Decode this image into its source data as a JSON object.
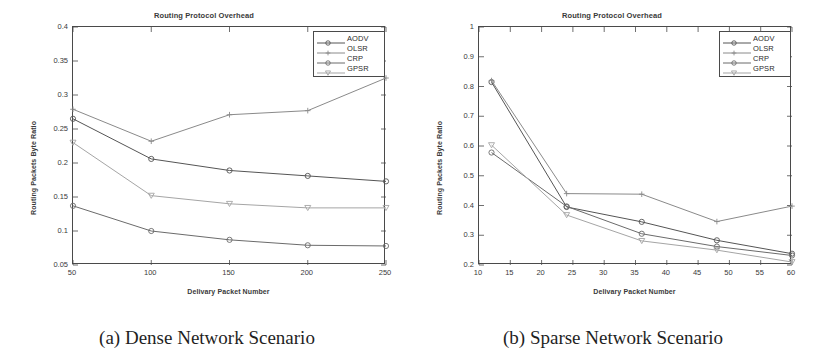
{
  "figure": {
    "panels": [
      {
        "id": "panel-a",
        "caption": "(a) Dense Network Scenario",
        "chart_data": {
          "type": "line",
          "title": "Routing Protocol Overhead",
          "xlabel": "Delivary Packet Number",
          "ylabel": "Routing Packets Byte Ratio",
          "x": [
            50,
            100,
            150,
            200,
            250
          ],
          "xtick_labels": [
            "50",
            "100",
            "150",
            "200",
            "250"
          ],
          "xlim": [
            50,
            250
          ],
          "ylim": [
            0.05,
            0.4
          ],
          "ytick_labels": [
            "0.4",
            "0.35",
            "0.3",
            "0.25",
            "0.2",
            "0.15",
            "0.1",
            "0.05"
          ],
          "yticks": [
            0.4,
            0.35,
            0.3,
            0.25,
            0.2,
            0.15,
            0.1,
            0.05
          ],
          "grid": false,
          "legend_position": "top-right",
          "series": [
            {
              "name": "AODV",
              "marker": "circle",
              "color": "#555555",
              "values": [
                0.265,
                0.206,
                0.189,
                0.181,
                0.173
              ]
            },
            {
              "name": "OLSR",
              "marker": "plus",
              "color": "#8a8a8a",
              "values": [
                0.279,
                0.232,
                0.271,
                0.277,
                0.325
              ]
            },
            {
              "name": "CRP",
              "marker": "circle",
              "color": "#6b6b6b",
              "values": [
                0.137,
                0.1,
                0.087,
                0.079,
                0.078
              ]
            },
            {
              "name": "GPSR",
              "marker": "triangle-down",
              "color": "#a5a5a5",
              "values": [
                0.23,
                0.152,
                0.14,
                0.134,
                0.134
              ]
            }
          ]
        }
      },
      {
        "id": "panel-b",
        "caption": "(b) Sparse Network Scenario",
        "chart_data": {
          "type": "line",
          "title": "Routing Protocol Overhead",
          "xlabel": "Delivary Packet Number",
          "ylabel": "Routing Packets Byte Ratio",
          "x": [
            12,
            24,
            36,
            48,
            60
          ],
          "xtick_labels": [
            "10",
            "15",
            "20",
            "25",
            "30",
            "35",
            "40",
            "45",
            "50",
            "55",
            "60"
          ],
          "xticks": [
            10,
            15,
            20,
            25,
            30,
            35,
            40,
            45,
            50,
            55,
            60
          ],
          "xlim": [
            10,
            60
          ],
          "ylim": [
            0.2,
            1.0
          ],
          "ytick_labels": [
            "1",
            "0.9",
            "0.8",
            "0.7",
            "0.6",
            "0.5",
            "0.4",
            "0.3",
            "0.2"
          ],
          "yticks": [
            1.0,
            0.9,
            0.8,
            0.7,
            0.6,
            0.5,
            0.4,
            0.3,
            0.2
          ],
          "grid": false,
          "legend_position": "top-right",
          "series": [
            {
              "name": "AODV",
              "marker": "circle",
              "color": "#555555",
              "values": [
                0.815,
                0.395,
                0.345,
                0.283,
                0.238
              ]
            },
            {
              "name": "OLSR",
              "marker": "plus",
              "color": "#8a8a8a",
              "values": [
                0.82,
                0.44,
                0.438,
                0.346,
                0.398
              ]
            },
            {
              "name": "CRP",
              "marker": "circle",
              "color": "#6b6b6b",
              "values": [
                0.578,
                0.397,
                0.305,
                0.262,
                0.232
              ]
            },
            {
              "name": "GPSR",
              "marker": "triangle-down",
              "color": "#a5a5a5",
              "values": [
                0.603,
                0.368,
                0.281,
                0.25,
                0.21
              ]
            }
          ]
        }
      }
    ]
  }
}
